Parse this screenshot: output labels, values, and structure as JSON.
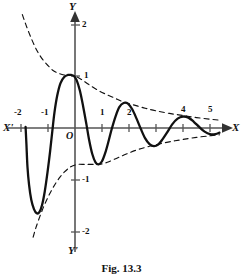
{
  "figure": {
    "caption": "Fig. 13.3",
    "axis_labels": {
      "x_positive": "X",
      "x_negative": "X'",
      "y_positive": "Y",
      "y_negative": "Y'",
      "origin": "O"
    },
    "ink_color": "#111111",
    "axis_color": "#555555"
  },
  "chart_data": {
    "type": "line",
    "title": "Fig. 13.3",
    "xlabel": "X",
    "ylabel": "Y",
    "xlim": [
      -2.1,
      5.4
    ],
    "ylim": [
      -2.25,
      2.25
    ],
    "grid": false,
    "legend": null,
    "xticks": [
      -2,
      -1,
      1,
      2,
      3,
      4,
      5
    ],
    "xtick_labels": [
      "-2",
      "-1",
      "1",
      "2",
      "3",
      "4",
      "5"
    ],
    "xtick_labels_shown": [
      "-2",
      "-1",
      "1",
      "2",
      "4",
      "5"
    ],
    "yticks": [
      -2,
      -1,
      1,
      2
    ],
    "ytick_labels": [
      "-2",
      "-1",
      "1",
      "2"
    ],
    "series": [
      {
        "name": "damped-oscillation",
        "style": "solid",
        "description": "y = cos(pi x)/ (1+|x|) type damped wave through (0,1)",
        "points": [
          [
            -1.83,
            0.02
          ],
          [
            -1.8,
            -0.3
          ],
          [
            -1.76,
            -0.75
          ],
          [
            -1.7,
            -1.1
          ],
          [
            -1.62,
            -1.38
          ],
          [
            -1.52,
            -1.56
          ],
          [
            -1.42,
            -1.64
          ],
          [
            -1.32,
            -1.62
          ],
          [
            -1.22,
            -1.48
          ],
          [
            -1.12,
            -1.22
          ],
          [
            -1.02,
            -0.86
          ],
          [
            -0.92,
            -0.44
          ],
          [
            -0.84,
            -0.06
          ],
          [
            -0.76,
            0.3
          ],
          [
            -0.66,
            0.62
          ],
          [
            -0.54,
            0.86
          ],
          [
            -0.4,
            0.98
          ],
          [
            -0.26,
            1.02
          ],
          [
            -0.14,
            1.02
          ],
          [
            -0.04,
            1.0
          ],
          [
            0.06,
            0.92
          ],
          [
            0.18,
            0.72
          ],
          [
            0.3,
            0.42
          ],
          [
            0.42,
            0.08
          ],
          [
            0.52,
            -0.22
          ],
          [
            0.64,
            -0.5
          ],
          [
            0.76,
            -0.66
          ],
          [
            0.88,
            -0.7
          ],
          [
            1.0,
            -0.64
          ],
          [
            1.12,
            -0.48
          ],
          [
            1.24,
            -0.26
          ],
          [
            1.36,
            -0.02
          ],
          [
            1.5,
            0.22
          ],
          [
            1.64,
            0.4
          ],
          [
            1.8,
            0.48
          ],
          [
            1.96,
            0.47
          ],
          [
            2.12,
            0.36
          ],
          [
            2.28,
            0.18
          ],
          [
            2.44,
            -0.02
          ],
          [
            2.6,
            -0.2
          ],
          [
            2.76,
            -0.31
          ],
          [
            2.92,
            -0.35
          ],
          [
            3.08,
            -0.32
          ],
          [
            3.24,
            -0.22
          ],
          [
            3.42,
            -0.08
          ],
          [
            3.6,
            0.07
          ],
          [
            3.8,
            0.18
          ],
          [
            4.0,
            0.22
          ],
          [
            4.2,
            0.2
          ],
          [
            4.4,
            0.12
          ],
          [
            4.6,
            0.02
          ],
          [
            4.8,
            -0.07
          ],
          [
            5.0,
            -0.12
          ],
          [
            5.2,
            -0.12
          ],
          [
            5.35,
            -0.09
          ]
        ]
      },
      {
        "name": "upper-envelope",
        "style": "dashed",
        "description": "upper decaying envelope",
        "points": [
          [
            -1.95,
            2.18
          ],
          [
            -1.8,
            1.96
          ],
          [
            -1.6,
            1.7
          ],
          [
            -1.4,
            1.48
          ],
          [
            -1.2,
            1.32
          ],
          [
            -1.0,
            1.2
          ],
          [
            -0.8,
            1.1
          ],
          [
            -0.6,
            1.05
          ],
          [
            -0.4,
            1.02
          ],
          [
            -0.2,
            1.01
          ],
          [
            0.0,
            1.0
          ],
          [
            0.25,
            0.93
          ],
          [
            0.5,
            0.84
          ],
          [
            0.8,
            0.74
          ],
          [
            1.1,
            0.66
          ],
          [
            1.45,
            0.58
          ],
          [
            1.8,
            0.5
          ],
          [
            2.2,
            0.44
          ],
          [
            2.6,
            0.38
          ],
          [
            3.0,
            0.33
          ],
          [
            3.5,
            0.28
          ],
          [
            4.0,
            0.24
          ],
          [
            4.5,
            0.2
          ],
          [
            5.0,
            0.17
          ],
          [
            5.35,
            0.15
          ]
        ]
      },
      {
        "name": "lower-envelope",
        "style": "dashed",
        "description": "lower decaying envelope",
        "points": [
          [
            -1.55,
            -2.1
          ],
          [
            -1.45,
            -1.92
          ],
          [
            -1.3,
            -1.7
          ],
          [
            -1.15,
            -1.5
          ],
          [
            -1.0,
            -1.33
          ],
          [
            -0.85,
            -1.18
          ],
          [
            -0.7,
            -1.05
          ],
          [
            -0.55,
            -0.94
          ],
          [
            -0.4,
            -0.85
          ],
          [
            -0.25,
            -0.78
          ],
          [
            -0.1,
            -0.73
          ],
          [
            0.1,
            -0.7
          ],
          [
            0.35,
            -0.7
          ],
          [
            0.6,
            -0.7
          ],
          [
            0.9,
            -0.7
          ],
          [
            1.2,
            -0.66
          ],
          [
            1.55,
            -0.58
          ],
          [
            1.9,
            -0.5
          ],
          [
            2.3,
            -0.42
          ],
          [
            2.7,
            -0.36
          ],
          [
            3.1,
            -0.31
          ],
          [
            3.55,
            -0.26
          ],
          [
            4.0,
            -0.22
          ],
          [
            4.5,
            -0.18
          ],
          [
            5.0,
            -0.15
          ],
          [
            5.35,
            -0.13
          ]
        ]
      }
    ]
  }
}
